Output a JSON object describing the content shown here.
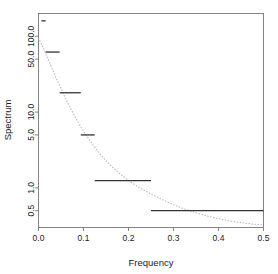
{
  "chart_data": {
    "type": "line",
    "title": "",
    "subtitle": "",
    "xlabel": "Frequency",
    "ylabel": "Spectrum",
    "xlim": [
      0.0,
      0.5
    ],
    "ylim": [
      0.3,
      200.0
    ],
    "yscale": "log",
    "grid": false,
    "legend": null,
    "annotations": [],
    "xticks": [
      "0.0",
      "0.1",
      "0.2",
      "0.3",
      "0.4",
      "0.5"
    ],
    "xtick_values": [
      0.0,
      0.1,
      0.2,
      0.3,
      0.4,
      0.5
    ],
    "yticks": [
      "0.5",
      "1.0",
      "5.0",
      "10.0",
      "50.0",
      "100.0"
    ],
    "ytick_values": [
      0.5,
      1.0,
      5.0,
      10.0,
      50.0,
      100.0
    ],
    "series": [
      {
        "name": "spectrum-step",
        "style": "step-segments",
        "color": "#333333",
        "segments": [
          {
            "x0": 0.0065,
            "x1": 0.016,
            "y": 160.0
          },
          {
            "x0": 0.016,
            "x1": 0.047,
            "y": 62.0
          },
          {
            "x0": 0.047,
            "x1": 0.094,
            "y": 18.0
          },
          {
            "x0": 0.094,
            "x1": 0.125,
            "y": 5.0
          },
          {
            "x0": 0.125,
            "x1": 0.25,
            "y": 1.25
          },
          {
            "x0": 0.25,
            "x1": 0.5,
            "y": 0.5
          }
        ]
      },
      {
        "name": "theoretical-curve",
        "style": "dotted",
        "color": "#b8b8b8",
        "x": [
          0.0,
          0.01,
          0.02,
          0.03,
          0.04,
          0.05,
          0.06,
          0.07,
          0.08,
          0.09,
          0.1,
          0.12,
          0.14,
          0.16,
          0.18,
          0.2,
          0.225,
          0.25,
          0.275,
          0.3,
          0.325,
          0.35,
          0.375,
          0.4,
          0.425,
          0.45,
          0.475,
          0.5
        ],
        "y": [
          95.0,
          72.0,
          52.0,
          38.0,
          27.5,
          20.5,
          15.2,
          11.6,
          8.9,
          7.0,
          5.6,
          3.75,
          2.65,
          1.98,
          1.55,
          1.25,
          1.0,
          0.83,
          0.7,
          0.6,
          0.525,
          0.47,
          0.425,
          0.392,
          0.366,
          0.347,
          0.333,
          0.325
        ]
      }
    ]
  },
  "axes": {
    "x_label": "Frequency",
    "y_label": "Spectrum"
  }
}
